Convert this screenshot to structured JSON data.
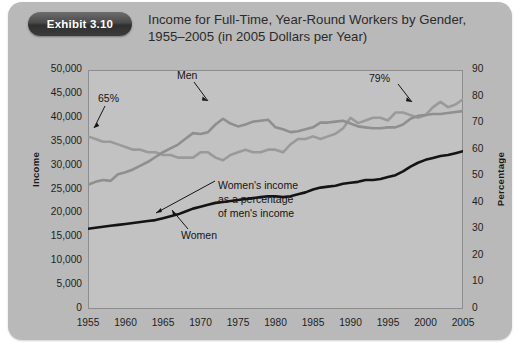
{
  "badge": {
    "label": "Exhibit 3.10"
  },
  "title": {
    "line1": "Income for Full-Time, Year-Round Workers by Gender,",
    "line2": "1955–2005 (in 2005 Dollars per Year)"
  },
  "axes": {
    "y_left_title": "Income",
    "y_right_title": "Percentage",
    "y_left_ticks": [
      "50,000",
      "45,000",
      "40,000",
      "35,000",
      "30,000",
      "25,000",
      "20,000",
      "15,000",
      "10,000",
      "5,000",
      "0"
    ],
    "y_right_ticks": [
      "90",
      "80",
      "70",
      "60",
      "50",
      "40",
      "30",
      "20",
      "10",
      "0"
    ],
    "x_ticks": [
      "1955",
      "1960",
      "1965",
      "1970",
      "1975",
      "1980",
      "1985",
      "1990",
      "1995",
      "2000",
      "2005"
    ]
  },
  "annotations": {
    "pct_start": "65%",
    "pct_end": "79%",
    "men": "Men",
    "women": "Women",
    "women_pct_l1": "Women's income",
    "women_pct_l2": "as a percentage",
    "women_pct_l3": "of men's income"
  },
  "colors": {
    "card": "#b9b9b9",
    "plot_bg": "#c2c2c2",
    "men_line": "#8f8f8f",
    "women_line": "#141414",
    "ratio_line": "#9a9a9a",
    "frame": "#8d8d8d",
    "badge": "#3a3a3a"
  },
  "chart_data": {
    "type": "line",
    "title": "Income for Full-Time, Year-Round Workers by Gender, 1955–2005 (in 2005 Dollars per Year)",
    "xlabel": "",
    "ylabel": "Income",
    "y2label": "Percentage",
    "xlim": [
      1955,
      2005
    ],
    "ylim": [
      0,
      50000
    ],
    "y2lim": [
      0,
      90
    ],
    "grid": false,
    "legend": "annotations-inline",
    "x": [
      1955,
      1956,
      1957,
      1958,
      1959,
      1960,
      1961,
      1962,
      1963,
      1964,
      1965,
      1966,
      1967,
      1968,
      1969,
      1970,
      1971,
      1972,
      1973,
      1974,
      1975,
      1976,
      1977,
      1978,
      1979,
      1980,
      1981,
      1982,
      1983,
      1984,
      1985,
      1986,
      1987,
      1988,
      1989,
      1990,
      1991,
      1992,
      1993,
      1994,
      1995,
      1996,
      1997,
      1998,
      1999,
      2000,
      2001,
      2002,
      2003,
      2004,
      2005
    ],
    "series": [
      {
        "name": "Men",
        "axis": "left",
        "color": "#8f8f8f",
        "values": [
          26000,
          26600,
          27000,
          26800,
          28200,
          28600,
          29200,
          30000,
          30800,
          31800,
          32800,
          33600,
          34400,
          35600,
          36800,
          36600,
          37000,
          38600,
          39800,
          38800,
          38200,
          38600,
          39200,
          39400,
          39600,
          38000,
          37600,
          37000,
          37200,
          37600,
          38000,
          39000,
          39000,
          39200,
          39400,
          38800,
          38200,
          38000,
          37800,
          37800,
          38000,
          38000,
          38600,
          39800,
          40400,
          40600,
          40800,
          40800,
          41000,
          41200,
          41400
        ]
      },
      {
        "name": "Women",
        "axis": "left",
        "color": "#141414",
        "values": [
          16800,
          17000,
          17200,
          17400,
          17600,
          17800,
          18000,
          18200,
          18400,
          18600,
          19000,
          19400,
          19800,
          20400,
          21000,
          21400,
          21800,
          22200,
          22400,
          22600,
          22800,
          23000,
          23200,
          23400,
          23600,
          23600,
          23400,
          23600,
          24000,
          24400,
          25000,
          25400,
          25600,
          25800,
          26200,
          26400,
          26600,
          27000,
          27000,
          27200,
          27600,
          28000,
          28800,
          29800,
          30600,
          31200,
          31600,
          32000,
          32200,
          32600,
          33000
        ]
      },
      {
        "name": "Women's income as a percentage of men's income",
        "axis": "right",
        "color": "#9a9a9a",
        "values": [
          65,
          64,
          63,
          63,
          62,
          61,
          60,
          60,
          59,
          59,
          58,
          58,
          57,
          57,
          57,
          59,
          59,
          57,
          56,
          58,
          59,
          60,
          59,
          59,
          60,
          60,
          59,
          62,
          64,
          64,
          65,
          64,
          65,
          66,
          68,
          72,
          70,
          71,
          72,
          72,
          71,
          74,
          74,
          73,
          72,
          73,
          76,
          78,
          76,
          77,
          79
        ]
      }
    ],
    "callouts": [
      {
        "text": "65%",
        "series": "ratio",
        "x": 1955,
        "y": 65
      },
      {
        "text": "79%",
        "series": "ratio",
        "x": 2005,
        "y": 79
      },
      {
        "text": "Men",
        "series": "men",
        "x": 1972,
        "y": 38600
      },
      {
        "text": "Women",
        "series": "women",
        "x": 1967,
        "y": 19800
      },
      {
        "text": "Women's income as a percentage of men's income",
        "series": "ratio",
        "x": 1988,
        "y": 66
      }
    ]
  }
}
